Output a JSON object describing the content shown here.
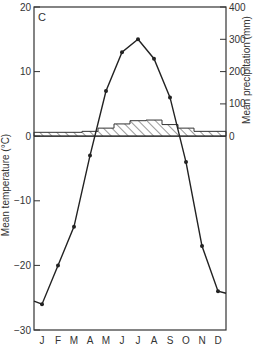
{
  "chart_data": {
    "type": "line",
    "panel_label": "C",
    "title": "",
    "xlabel": "",
    "ylabel": "Mean temperature (°C)",
    "ylabel_right": "Mean precipitation (mm)",
    "categories": [
      "J",
      "F",
      "M",
      "A",
      "M",
      "J",
      "J",
      "A",
      "S",
      "O",
      "N",
      "D"
    ],
    "ylim": [
      -30,
      20
    ],
    "ylim_right": [
      0,
      400
    ],
    "yticks": [
      20,
      10,
      0,
      -10,
      -20,
      -30
    ],
    "yticks_right": [
      400,
      300,
      200,
      100,
      0
    ],
    "grid": false,
    "series": [
      {
        "name": "Mean temperature (°C)",
        "type": "line",
        "axis": "left",
        "markers": true,
        "values": [
          -26,
          -20,
          -14,
          -3,
          7,
          13,
          15,
          12,
          6,
          -4,
          -17,
          -24
        ]
      },
      {
        "name": "Mean precipitation (mm)",
        "type": "bar",
        "style": "hatched-step",
        "axis": "right",
        "values": [
          12,
          12,
          12,
          15,
          25,
          38,
          48,
          50,
          36,
          25,
          15,
          15
        ]
      }
    ]
  },
  "labels": {
    "panel": "C",
    "left_axis_title": "Mean temperature (°C)",
    "right_axis_title": "Mean precipitation (mm)",
    "left_ticks": [
      "20",
      "10",
      "0",
      "−10",
      "−20",
      "−30"
    ],
    "right_ticks": [
      "400",
      "300",
      "200",
      "100",
      "0"
    ],
    "months": [
      "J",
      "F",
      "M",
      "A",
      "M",
      "J",
      "J",
      "A",
      "S",
      "O",
      "N",
      "D"
    ]
  }
}
